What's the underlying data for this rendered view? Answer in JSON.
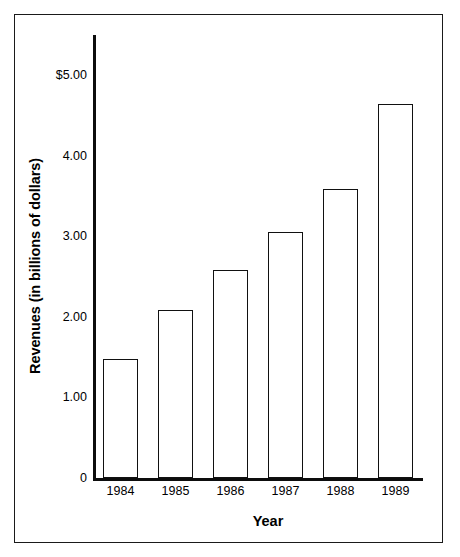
{
  "chart_data": {
    "type": "bar",
    "title": "",
    "subtitle": "",
    "xlabel": "Year",
    "ylabel": "Revenues (in billions of dollars)",
    "categories": [
      "1984",
      "1985",
      "1986",
      "1987",
      "1988",
      "1989"
    ],
    "values": [
      1.48,
      2.09,
      2.58,
      3.06,
      3.59,
      4.64
    ],
    "series": [
      {
        "name": "Revenues",
        "values": [
          1.48,
          2.09,
          2.58,
          3.06,
          3.59,
          4.64
        ]
      }
    ],
    "ylim": [
      0,
      5.5
    ],
    "ytick_values": [
      5.0,
      4.0,
      3.0,
      2.0,
      1.0,
      0
    ],
    "ytick_labels": [
      "$5.00",
      "4.00",
      "3.00",
      "2.00",
      "1.00",
      "0"
    ],
    "grid": false,
    "legend": false,
    "legend_position": "none",
    "bar_fill_color": "#ffffff",
    "bar_edge_color": "#111111",
    "axis_color": "#0d0d0d",
    "background_color": "#ffffff",
    "frame_color": "#1a1a1a"
  }
}
